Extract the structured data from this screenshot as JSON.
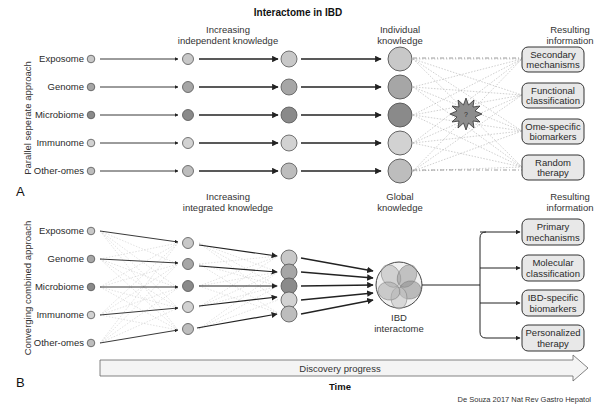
{
  "figure": {
    "title": "Interactome in IBD",
    "citation": "De Souza 2017 Nat Rev Gastro Hepatol",
    "colors": {
      "light": "#c8c8c8",
      "medium": "#a6a6a6",
      "dark": "#8a8a8a",
      "box_fill": "#e8e8e8",
      "stroke": "#333333"
    }
  },
  "panel_a": {
    "letter": "A",
    "side_label": "Parallel seperate approach",
    "header_mid_1": "Increasing",
    "header_mid_2": "independent knowledge",
    "header_right_1": "Individual",
    "header_right_2": "knowledge",
    "header_result_1": "Resulting",
    "header_result_2": "information",
    "omes": [
      "Exposome",
      "Genome",
      "Microbiome",
      "Immunome",
      "Other-omes"
    ],
    "star_icon": "question-star-icon",
    "star_text": "?",
    "results": [
      {
        "line1": "Secondary",
        "line2": "mechanisms"
      },
      {
        "line1": "Functional",
        "line2": "classification"
      },
      {
        "line1": "Ome-specific",
        "line2": "biomarkers"
      },
      {
        "line1": "Random",
        "line2": "therapy"
      }
    ]
  },
  "panel_b": {
    "letter": "B",
    "side_label": "Converging combined approach",
    "header_mid_1": "Increasing",
    "header_mid_2": "integrated knowledge",
    "header_right_1": "Global",
    "header_right_2": "knowledge",
    "header_result_1": "Resulting",
    "header_result_2": "information",
    "omes": [
      "Exposome",
      "Genome",
      "Microbiome",
      "Immunome",
      "Other-omes"
    ],
    "interactome_1": "IBD",
    "interactome_2": "interactome",
    "results": [
      {
        "line1": "Primary",
        "line2": "mechanisms"
      },
      {
        "line1": "Molecular",
        "line2": "classification"
      },
      {
        "line1": "IBD-specific",
        "line2": "biomarkers"
      },
      {
        "line1": "Personalized",
        "line2": "therapy"
      }
    ]
  },
  "timeline": {
    "arrow_label": "Discovery progress",
    "axis_label": "Time"
  }
}
